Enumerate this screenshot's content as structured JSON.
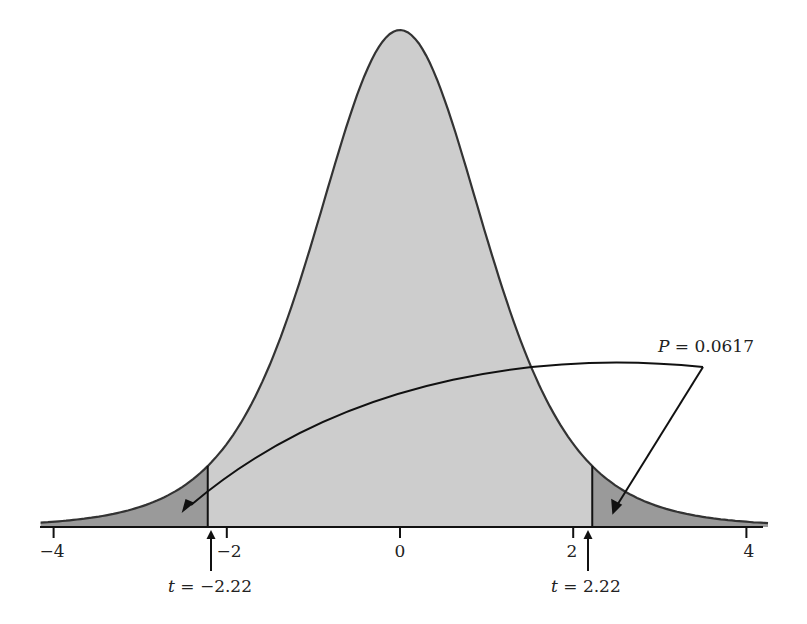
{
  "chart_data": {
    "type": "area",
    "title": "",
    "xlabel": "",
    "ylabel": "",
    "xlim": [
      -4.2,
      4.3
    ],
    "x_ticks": [
      -4,
      -2,
      0,
      2,
      4
    ],
    "x_tick_labels": [
      "−4",
      "−2",
      "0",
      "2",
      "4"
    ],
    "grid": false,
    "legend": null,
    "curve": {
      "distribution": "t",
      "df": 6,
      "center": 0
    },
    "shaded_regions": [
      {
        "name": "left-tail",
        "from": -4.2,
        "to": -2.22,
        "color": "#9a9a9a"
      },
      {
        "name": "body",
        "from": -2.22,
        "to": 2.22,
        "color": "#cdcdcd"
      },
      {
        "name": "right-tail",
        "from": 2.22,
        "to": 4.3,
        "color": "#9a9a9a"
      }
    ],
    "critical_values": [
      -2.22,
      2.22
    ],
    "annotations": [
      {
        "text": "P = 0.0617",
        "italic_part": "P",
        "points_to": [
          "left-tail",
          "right-tail"
        ]
      },
      {
        "text": "t = −2.22",
        "italic_part": "t",
        "x": -2.22
      },
      {
        "text": "t = 2.22",
        "italic_part": "t",
        "x": 2.22
      }
    ],
    "p_value": 0.0617
  },
  "labels": {
    "p_var": "P",
    "p_rest": " = 0.0617",
    "t_var": "t",
    "t_left_rest": " = −2.22",
    "t_right_rest": " = 2.22",
    "tick_m4": "−4",
    "tick_m2": "−2",
    "tick_0": "0",
    "tick_2": "2",
    "tick_4": "4"
  },
  "colors": {
    "body_fill": "#cdcdcd",
    "tail_fill": "#9a9a9a",
    "curve_stroke": "#333333",
    "axis": "#111111"
  }
}
